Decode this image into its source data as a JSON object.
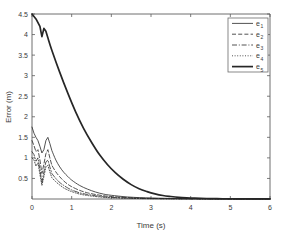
{
  "chart_data": {
    "type": "line",
    "title": "",
    "xlabel": "Time (s)",
    "ylabel": "Error (m)",
    "xlim": [
      0,
      6
    ],
    "ylim": [
      0,
      4.5
    ],
    "xticks": [
      0,
      1,
      2,
      3,
      4,
      5,
      6
    ],
    "xtick_labels": [
      "0",
      "1",
      "2",
      "3",
      "4",
      "5",
      "6"
    ],
    "yticks": [
      0.5,
      1,
      1.5,
      2,
      2.5,
      3,
      3.5,
      4,
      4.5
    ],
    "ytick_labels": [
      "0.5",
      "1",
      "1.5",
      "2",
      "2.5",
      "3",
      "3.5",
      "4",
      "4.5"
    ],
    "grid": false,
    "legend_position": "upper right",
    "background": "#ffffff",
    "line_color": "#262626",
    "series": [
      {
        "name": "e1",
        "label_base": "e",
        "label_sub": "1",
        "style": "solid",
        "width": 0.8,
        "x": [
          0,
          0.05,
          0.1,
          0.15,
          0.2,
          0.25,
          0.3,
          0.35,
          0.4,
          0.45,
          0.5,
          0.6,
          0.7,
          0.8,
          0.9,
          1.0,
          1.2,
          1.4,
          1.6,
          1.8,
          2.0,
          2.4,
          2.8,
          3.2,
          3.6,
          4.0,
          4.5,
          5.0,
          5.5,
          6.0
        ],
        "values": [
          1.75,
          1.6,
          1.5,
          1.42,
          1.28,
          1.12,
          1.2,
          1.42,
          1.5,
          1.35,
          1.18,
          0.95,
          0.78,
          0.65,
          0.55,
          0.46,
          0.33,
          0.24,
          0.17,
          0.12,
          0.09,
          0.05,
          0.03,
          0.02,
          0.012,
          0.008,
          0.005,
          0.003,
          0.002,
          0.001
        ]
      },
      {
        "name": "e2",
        "label_base": "e",
        "label_sub": "2",
        "style": "dashed",
        "width": 0.8,
        "x": [
          0,
          0.05,
          0.1,
          0.15,
          0.2,
          0.25,
          0.3,
          0.35,
          0.4,
          0.45,
          0.5,
          0.6,
          0.7,
          0.8,
          0.9,
          1.0,
          1.2,
          1.4,
          1.6,
          1.8,
          2.0,
          2.4,
          2.8,
          3.2,
          3.6,
          4.0,
          4.5,
          5.0,
          5.5,
          6.0
        ],
        "values": [
          1.42,
          1.3,
          1.15,
          1.2,
          0.95,
          0.62,
          0.85,
          1.1,
          1.2,
          1.0,
          0.82,
          0.66,
          0.54,
          0.44,
          0.36,
          0.3,
          0.21,
          0.15,
          0.11,
          0.08,
          0.06,
          0.035,
          0.02,
          0.012,
          0.008,
          0.005,
          0.003,
          0.002,
          0.001,
          0.001
        ]
      },
      {
        "name": "e3",
        "label_base": "e",
        "label_sub": "3",
        "style": "dashdot",
        "width": 0.8,
        "x": [
          0,
          0.05,
          0.1,
          0.15,
          0.2,
          0.25,
          0.3,
          0.35,
          0.4,
          0.45,
          0.5,
          0.6,
          0.7,
          0.8,
          0.9,
          1.0,
          1.2,
          1.4,
          1.6,
          1.8,
          2.0,
          2.4,
          2.8,
          3.2,
          3.6,
          4.0,
          4.5,
          5.0,
          5.5,
          6.0
        ],
        "values": [
          1.15,
          1.08,
          0.92,
          1.0,
          0.72,
          0.4,
          0.66,
          0.9,
          0.95,
          0.78,
          0.62,
          0.5,
          0.4,
          0.33,
          0.27,
          0.22,
          0.15,
          0.11,
          0.08,
          0.055,
          0.04,
          0.022,
          0.013,
          0.008,
          0.005,
          0.003,
          0.002,
          0.001,
          0.001,
          0.001
        ]
      },
      {
        "name": "e4",
        "label_base": "e",
        "label_sub": "4",
        "style": "dotted",
        "width": 0.8,
        "x": [
          0,
          0.05,
          0.1,
          0.15,
          0.2,
          0.25,
          0.3,
          0.35,
          0.4,
          0.45,
          0.5,
          0.6,
          0.7,
          0.8,
          0.9,
          1.0,
          1.2,
          1.4,
          1.6,
          1.8,
          2.0,
          2.4,
          2.8,
          3.2,
          3.6,
          4.0,
          4.5,
          5.0,
          5.5,
          6.0
        ],
        "values": [
          1.0,
          0.95,
          0.8,
          0.88,
          0.6,
          0.33,
          0.55,
          0.78,
          0.82,
          0.66,
          0.52,
          0.42,
          0.34,
          0.27,
          0.22,
          0.18,
          0.12,
          0.085,
          0.06,
          0.042,
          0.03,
          0.017,
          0.01,
          0.006,
          0.004,
          0.002,
          0.001,
          0.001,
          0.001,
          0.001
        ]
      },
      {
        "name": "e5",
        "label_base": "e",
        "label_sub": "5",
        "style": "thick-solid",
        "width": 1.7,
        "x": [
          0,
          0.1,
          0.2,
          0.25,
          0.3,
          0.35,
          0.4,
          0.5,
          0.7,
          0.9,
          1.1,
          1.3,
          1.5,
          1.7,
          1.9,
          2.1,
          2.3,
          2.5,
          2.7,
          2.9,
          3.1,
          3.3,
          3.5,
          3.7,
          3.9,
          4.1,
          4.4,
          4.8,
          5.2,
          5.6,
          6.0
        ],
        "values": [
          4.5,
          4.38,
          4.2,
          3.95,
          4.15,
          4.08,
          3.92,
          3.62,
          3.08,
          2.58,
          2.12,
          1.72,
          1.38,
          1.08,
          0.84,
          0.64,
          0.48,
          0.35,
          0.25,
          0.18,
          0.125,
          0.085,
          0.06,
          0.04,
          0.028,
          0.02,
          0.012,
          0.006,
          0.003,
          0.002,
          0.001
        ]
      }
    ]
  },
  "legend": {
    "entries": [
      {
        "base": "e",
        "sub": "1"
      },
      {
        "base": "e",
        "sub": "2"
      },
      {
        "base": "e",
        "sub": "3"
      },
      {
        "base": "e",
        "sub": "4"
      },
      {
        "base": "e",
        "sub": "5"
      }
    ]
  }
}
